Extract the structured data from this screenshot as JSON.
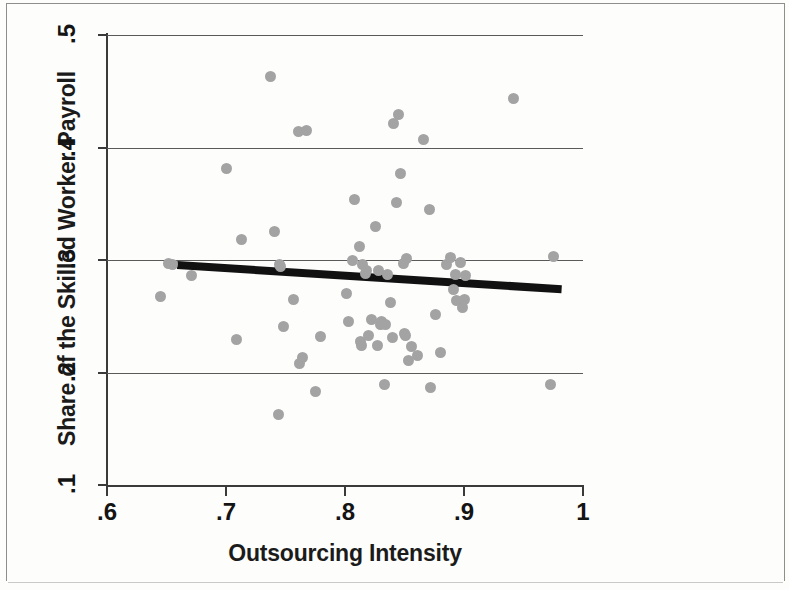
{
  "chart_data": {
    "type": "scatter",
    "title": "",
    "xlabel": "Outsourcing Intensity",
    "ylabel": "Share of the Skilled Worker Payroll",
    "xlim": [
      0.6,
      1.0
    ],
    "ylim": [
      0.1,
      0.5
    ],
    "xticks": [
      ".6",
      ".7",
      ".8",
      ".9",
      "1"
    ],
    "xtick_values": [
      0.6,
      0.7,
      0.8,
      0.9,
      1.0
    ],
    "yticks": [
      ".1",
      ".2",
      ".3",
      ".4",
      ".5"
    ],
    "ytick_values": [
      0.1,
      0.2,
      0.3,
      0.4,
      0.5
    ],
    "grid": "horizontal",
    "legend": "none",
    "marker_color": "#a3a3a3",
    "line_color": "#111111",
    "axis_color": "#3a3a3a",
    "points": [
      [
        0.645,
        0.268
      ],
      [
        0.652,
        0.297
      ],
      [
        0.655,
        0.296
      ],
      [
        0.671,
        0.286
      ],
      [
        0.7,
        0.381
      ],
      [
        0.709,
        0.229
      ],
      [
        0.713,
        0.318
      ],
      [
        0.737,
        0.463
      ],
      [
        0.741,
        0.325
      ],
      [
        0.744,
        0.163
      ],
      [
        0.745,
        0.296
      ],
      [
        0.746,
        0.294
      ],
      [
        0.748,
        0.241
      ],
      [
        0.757,
        0.265
      ],
      [
        0.761,
        0.414
      ],
      [
        0.762,
        0.208
      ],
      [
        0.764,
        0.213
      ],
      [
        0.768,
        0.415
      ],
      [
        0.775,
        0.183
      ],
      [
        0.779,
        0.232
      ],
      [
        0.801,
        0.27
      ],
      [
        0.803,
        0.245
      ],
      [
        0.806,
        0.3
      ],
      [
        0.808,
        0.354
      ],
      [
        0.812,
        0.312
      ],
      [
        0.813,
        0.228
      ],
      [
        0.814,
        0.224
      ],
      [
        0.815,
        0.296
      ],
      [
        0.817,
        0.288
      ],
      [
        0.818,
        0.291
      ],
      [
        0.82,
        0.233
      ],
      [
        0.822,
        0.247
      ],
      [
        0.826,
        0.33
      ],
      [
        0.827,
        0.224
      ],
      [
        0.828,
        0.291
      ],
      [
        0.83,
        0.243
      ],
      [
        0.831,
        0.245
      ],
      [
        0.833,
        0.189
      ],
      [
        0.834,
        0.243
      ],
      [
        0.836,
        0.287
      ],
      [
        0.838,
        0.262
      ],
      [
        0.84,
        0.231
      ],
      [
        0.841,
        0.421
      ],
      [
        0.843,
        0.351
      ],
      [
        0.845,
        0.429
      ],
      [
        0.847,
        0.377
      ],
      [
        0.849,
        0.297
      ],
      [
        0.85,
        0.235
      ],
      [
        0.851,
        0.233
      ],
      [
        0.852,
        0.301
      ],
      [
        0.853,
        0.211
      ],
      [
        0.856,
        0.223
      ],
      [
        0.861,
        0.215
      ],
      [
        0.866,
        0.407
      ],
      [
        0.871,
        0.345
      ],
      [
        0.872,
        0.187
      ],
      [
        0.876,
        0.252
      ],
      [
        0.88,
        0.218
      ],
      [
        0.885,
        0.296
      ],
      [
        0.889,
        0.302
      ],
      [
        0.891,
        0.274
      ],
      [
        0.893,
        0.287
      ],
      [
        0.894,
        0.264
      ],
      [
        0.897,
        0.298
      ],
      [
        0.899,
        0.258
      ],
      [
        0.9,
        0.265
      ],
      [
        0.901,
        0.286
      ],
      [
        0.942,
        0.444
      ],
      [
        0.973,
        0.189
      ],
      [
        0.975,
        0.303
      ]
    ],
    "fit_line": {
      "x0": 0.659,
      "y0": 0.2955,
      "x1": 0.982,
      "y1": 0.274,
      "style": "thick-solid"
    }
  }
}
